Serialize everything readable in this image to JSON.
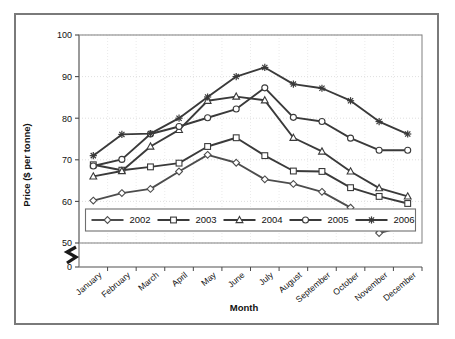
{
  "chart_data": {
    "type": "line",
    "title": "",
    "xlabel": "Month",
    "ylabel": "Price ($ per tonne)",
    "categories": [
      "January",
      "February",
      "March",
      "April",
      "May",
      "June",
      "July",
      "August",
      "September",
      "October",
      "November",
      "December"
    ],
    "ylim": [
      50,
      100
    ],
    "yticks": [
      50,
      60,
      70,
      80,
      90,
      100
    ],
    "y_axis_break": true,
    "y_axis_break_label": "0",
    "grid": true,
    "legend_position": "inside-bottom-center",
    "series": [
      {
        "name": "2002",
        "marker": "diamond",
        "color": "#4d4d4d",
        "values": [
          60.2,
          62.0,
          63.0,
          67.2,
          71.2,
          69.3,
          65.3,
          64.2,
          62.3,
          58.5,
          52.4,
          54.2
        ]
      },
      {
        "name": "2003",
        "marker": "square",
        "color": "#3a3a3a",
        "values": [
          68.8,
          67.5,
          68.3,
          69.2,
          73.2,
          75.3,
          71.0,
          67.3,
          67.2,
          63.3,
          61.2,
          59.5
        ]
      },
      {
        "name": "2004",
        "marker": "triangle",
        "color": "#3a3a3a",
        "values": [
          66.0,
          67.3,
          73.2,
          77.2,
          84.2,
          85.2,
          84.3,
          75.3,
          72.0,
          67.2,
          63.2,
          61.2
        ]
      },
      {
        "name": "2005",
        "marker": "circle",
        "color": "#3a3a3a",
        "values": [
          68.5,
          70.1,
          76.2,
          78.0,
          80.1,
          82.2,
          87.3,
          80.2,
          79.2,
          75.2,
          72.3,
          72.3
        ]
      },
      {
        "name": "2006",
        "marker": "star",
        "color": "#3a3a3a",
        "values": [
          71.0,
          76.1,
          76.3,
          80.0,
          85.1,
          90.0,
          92.2,
          88.2,
          87.2,
          84.2,
          79.2,
          76.2
        ]
      }
    ]
  },
  "axes": {
    "y_label": "Price ($ per tonne)",
    "x_label": "Month",
    "y_ticks": [
      "100",
      "90",
      "80",
      "70",
      "60",
      "50",
      "0"
    ],
    "x_ticks": [
      "January",
      "February",
      "March",
      "April",
      "May",
      "June",
      "July",
      "August",
      "September",
      "October",
      "November",
      "December"
    ]
  },
  "legend": {
    "items": [
      {
        "label": "2002",
        "marker": "diamond"
      },
      {
        "label": "2003",
        "marker": "square"
      },
      {
        "label": "2004",
        "marker": "triangle"
      },
      {
        "label": "2005",
        "marker": "circle"
      },
      {
        "label": "2006",
        "marker": "star"
      }
    ]
  }
}
